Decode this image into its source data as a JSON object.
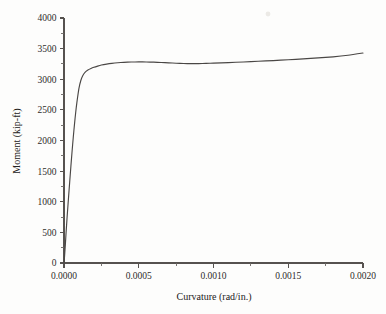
{
  "figure": {
    "background_color": "#fdfdfc",
    "line_color": "#4a4745",
    "axis_color": "#56524f",
    "text_color": "#2e2c2b"
  },
  "chart_data": {
    "type": "line",
    "title": "",
    "subtitle": "",
    "xlabel": "Curvature (rad/in.)",
    "ylabel": "Moment (kip-ft)",
    "xlim": [
      0.0,
      0.002
    ],
    "ylim": [
      0,
      4000
    ],
    "grid": false,
    "legend": null,
    "legend_position": "none",
    "xticks": [
      0.0,
      0.0005,
      0.001,
      0.0015,
      0.002
    ],
    "xtick_labels": [
      "0.0000",
      "0.0005",
      "0.0010",
      "0.0015",
      "0.0020"
    ],
    "xminor_count_between": 1,
    "yticks": [
      0,
      500,
      1000,
      1500,
      2000,
      2500,
      3000,
      3500,
      4000
    ],
    "ytick_labels": [
      "0",
      "500",
      "1000",
      "1500",
      "2000",
      "2500",
      "3000",
      "3500",
      "4000"
    ],
    "yminor_count_between": 1,
    "series": [
      {
        "name": "moment-curvature",
        "x": [
          0.0,
          4e-06,
          9e-06,
          1.4e-05,
          2e-05,
          2.7e-05,
          3.4e-05,
          4.2e-05,
          5e-05,
          5.8e-05,
          6.6e-05,
          7.4e-05,
          8.2e-05,
          9e-05,
          0.0001,
          0.000112,
          0.000126,
          0.000142,
          0.00016,
          0.00018,
          0.0002,
          0.000225,
          0.00025,
          0.000285,
          0.00032,
          0.00036,
          0.0004,
          0.00045,
          0.0005,
          0.00055,
          0.0006,
          0.00065,
          0.0007,
          0.00075,
          0.0008,
          0.00085,
          0.0009,
          0.00095,
          0.001,
          0.0011,
          0.0012,
          0.0013,
          0.0014,
          0.0015,
          0.0016,
          0.0017,
          0.0018,
          0.0019,
          0.002
        ],
        "y": [
          0,
          120,
          300,
          500,
          720,
          960,
          1190,
          1450,
          1700,
          1940,
          2160,
          2360,
          2540,
          2690,
          2850,
          2975,
          3060,
          3115,
          3150,
          3175,
          3195,
          3215,
          3232,
          3248,
          3260,
          3270,
          3276,
          3281,
          3283,
          3282,
          3279,
          3274,
          3268,
          3262,
          3257,
          3255,
          3256,
          3259,
          3263,
          3272,
          3282,
          3293,
          3305,
          3318,
          3332,
          3348,
          3366,
          3392,
          3428
        ]
      }
    ],
    "annotations": [],
    "notes": {
      "shape": "Steep near-vertical elastic branch to first yield, sharp knee near 3100 kip-ft, broad plateau peaking about 3283 kip-ft at 0.0005 rad/in., shallow trough near 3255 kip-ft at 0.00085 rad/in., then gradual strain-hardening rise to about 3428 kip-ft at 0.0020 rad/in."
    }
  }
}
